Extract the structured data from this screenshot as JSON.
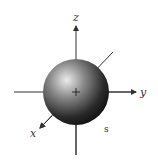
{
  "diagram": {
    "type": "orbital",
    "orbital_label": "s",
    "axes": {
      "x": "x",
      "y": "y",
      "z": "z"
    },
    "colors": {
      "axis": "#333333",
      "sphere_highlight": "#e8e8e8",
      "sphere_shadow": "#111111"
    }
  }
}
